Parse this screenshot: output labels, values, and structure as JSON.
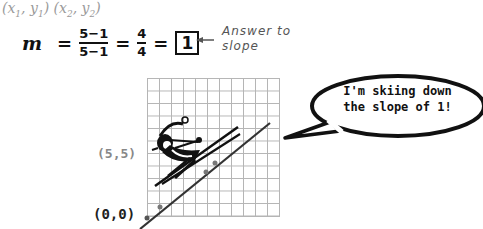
{
  "points_notation": {
    "p1": "(x",
    "p1_sub_x": "1",
    "p1_mid": ", y",
    "p1_sub_y": "1",
    "p1_end": ")",
    "p2": "(x",
    "p2_sub_x": "2",
    "p2_mid": ", y",
    "p2_sub_y": "2",
    "p2_end": ")"
  },
  "equation": {
    "variable": "m",
    "equals": "=",
    "numerator": "5−1",
    "denominator": "5−1",
    "simplified_numerator": "4",
    "simplified_denominator": "4",
    "result": "1"
  },
  "annotation": {
    "line1": "Answer to",
    "line2": "slope"
  },
  "graph": {
    "label_top_point": "(5,5)",
    "label_origin": "(0,0)",
    "line_slope": 1,
    "grid_color": "#b5b5b5",
    "line_color": "#333333"
  },
  "speech_bubble": {
    "line1": "I'm skiing down",
    "line2": "the slope of 1!"
  }
}
